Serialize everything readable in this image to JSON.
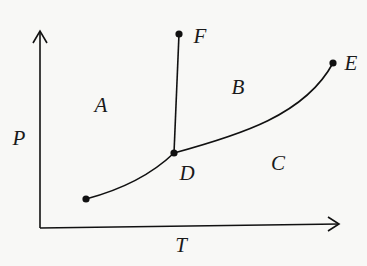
{
  "diagram": {
    "type": "phase-diagram",
    "axes": {
      "x_label": "T",
      "y_label": "P"
    },
    "regions": [
      {
        "label": "A"
      },
      {
        "label": "B"
      },
      {
        "label": "C"
      }
    ],
    "points": [
      {
        "label": "D"
      },
      {
        "label": "E"
      },
      {
        "label": "F"
      }
    ],
    "colors": {
      "line": "#111111",
      "background": "#f8f8f6"
    }
  }
}
